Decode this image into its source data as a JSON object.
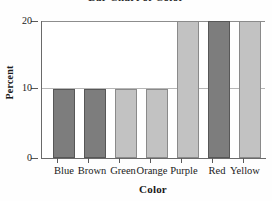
{
  "chart_data": {
    "type": "bar",
    "title": "Bar Chart of Color",
    "xlabel": "Color",
    "ylabel": "Percent",
    "categories": [
      "Blue",
      "Brown",
      "Green",
      "Orange",
      "Purple",
      "Red",
      "Yellow"
    ],
    "values": [
      10,
      10,
      10,
      10,
      20,
      20,
      20
    ],
    "bar_styles": [
      "dark",
      "dark",
      "light",
      "light",
      "light",
      "dark",
      "light"
    ],
    "ylim": [
      0,
      20
    ],
    "yticks": [
      0,
      10,
      20
    ],
    "ytick_labels": [
      "0",
      "10",
      "20"
    ],
    "grid": "horizontal-at-10-and-20",
    "legend": "none",
    "colors": {
      "dark_bar": "#7d7d7d",
      "light_bar": "#c2c2c2",
      "dark_border": "#575757",
      "light_border": "#8a8a8a",
      "axis": "#6a6a6a",
      "gridline": "#b6b6b6",
      "background": "#ffffff"
    }
  }
}
